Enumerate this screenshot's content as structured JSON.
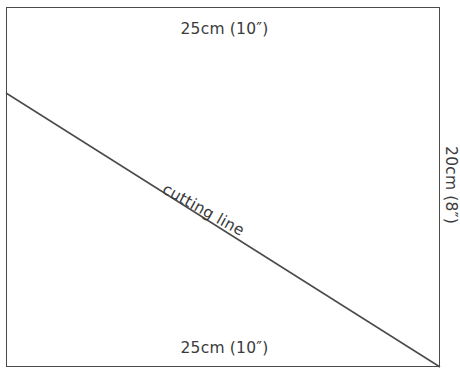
{
  "diagram": {
    "shape": "rectangle",
    "line_color": "#4a4a4a",
    "text_color": "#3b3b3b",
    "background_color": "#ffffff",
    "labels": {
      "top": "25cm (10″)",
      "bottom": "25cm (10″)",
      "right": "20cm (8″)",
      "cutting_line": "cutting line"
    },
    "geometry": {
      "rect_left": 6,
      "rect_top": 7,
      "rect_width": 434,
      "rect_height": 360,
      "cut_start_x": 6,
      "cut_start_y": 93,
      "cut_end_x": 440,
      "cut_end_y": 367
    }
  }
}
